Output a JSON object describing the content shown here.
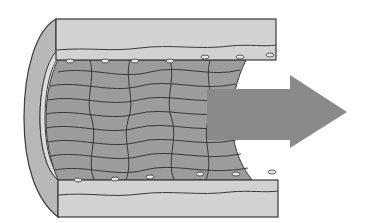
{
  "diagram": {
    "colors": {
      "background": "#ffffff",
      "outer_wall": "#cfcfcf",
      "wall_stroke": "#3a3a3a",
      "lumen_cells": "#9a9a9a",
      "cap": "#b8b8b8",
      "arrow": "#8a8a8a"
    },
    "parts": [
      {
        "name": "outer-wall-top"
      },
      {
        "name": "outer-wall-bottom"
      },
      {
        "name": "endothelial-layer"
      },
      {
        "name": "vessel-end-cap"
      },
      {
        "name": "flow-arrow"
      }
    ]
  }
}
